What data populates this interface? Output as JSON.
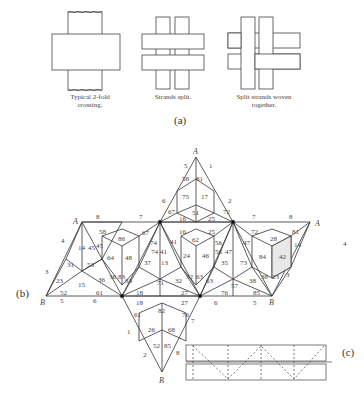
{
  "part_a": {
    "label": "(a)",
    "captions": [
      "Typical 2-fold crossing.",
      "Strands split.",
      "Split strands woven together."
    ],
    "caption_lines": [
      [
        "Typical 2-fold",
        "crossing."
      ],
      [
        "Strands split."
      ],
      [
        "Split strands woven",
        "together."
      ]
    ]
  },
  "part_b": {
    "label": "(b)",
    "vertex_labels": {
      "top": "A",
      "left_top": "A",
      "right_top": "A",
      "left_bottom": "B",
      "right_bottom": "B",
      "bottom": "B"
    },
    "arrow_labels": [
      {
        "text": "5",
        "x": 186,
        "y": 168
      },
      {
        "text": "1",
        "x": 211,
        "y": 168
      },
      {
        "text": "6",
        "x": 164,
        "y": 203
      },
      {
        "text": "2",
        "x": 230,
        "y": 203
      },
      {
        "text": "8",
        "x": 98,
        "y": 219
      },
      {
        "text": "7",
        "x": 141,
        "y": 219
      },
      {
        "text": "7",
        "x": 254,
        "y": 219
      },
      {
        "text": "8",
        "x": 291,
        "y": 219
      },
      {
        "text": "4",
        "x": 63,
        "y": 243
      },
      {
        "text": "4",
        "x": 345,
        "y": 246
      },
      {
        "text": "3",
        "x": 47,
        "y": 274
      },
      {
        "text": "3",
        "x": 288,
        "y": 277
      },
      {
        "text": "5",
        "x": 62,
        "y": 303
      },
      {
        "text": "6",
        "x": 95,
        "y": 303
      },
      {
        "text": "6",
        "x": 216,
        "y": 305
      },
      {
        "text": "5",
        "x": 255,
        "y": 305
      },
      {
        "text": "1",
        "x": 129,
        "y": 334
      },
      {
        "text": "7",
        "x": 193,
        "y": 323
      },
      {
        "text": "2",
        "x": 145,
        "y": 357
      },
      {
        "text": "8",
        "x": 178,
        "y": 355
      }
    ],
    "cell_numbers": [
      {
        "text": "58",
        "x": 186,
        "y": 179
      },
      {
        "text": "81",
        "x": 200,
        "y": 179
      },
      {
        "text": "75",
        "x": 186,
        "y": 197
      },
      {
        "text": "17",
        "x": 205,
        "y": 197
      },
      {
        "text": "67",
        "x": 172,
        "y": 212
      },
      {
        "text": "51",
        "x": 196,
        "y": 213
      },
      {
        "text": "72",
        "x": 227,
        "y": 212
      },
      {
        "text": "16",
        "x": 183,
        "y": 219
      },
      {
        "text": "25",
        "x": 212,
        "y": 219
      },
      {
        "text": "58",
        "x": 103,
        "y": 232
      },
      {
        "text": "86",
        "x": 122,
        "y": 239
      },
      {
        "text": "67",
        "x": 146,
        "y": 233
      },
      {
        "text": "16",
        "x": 183,
        "y": 232
      },
      {
        "text": "62",
        "x": 196,
        "y": 240
      },
      {
        "text": "25",
        "x": 212,
        "y": 232
      },
      {
        "text": "72",
        "x": 255,
        "y": 232
      },
      {
        "text": "28",
        "x": 274,
        "y": 239
      },
      {
        "text": "81",
        "x": 296,
        "y": 232
      },
      {
        "text": "14",
        "x": 82,
        "y": 248
      },
      {
        "text": "45",
        "x": 92,
        "y": 248
      },
      {
        "text": "45",
        "x": 100,
        "y": 246
      },
      {
        "text": "74",
        "x": 154,
        "y": 243
      },
      {
        "text": "74",
        "x": 155,
        "y": 252
      },
      {
        "text": "41",
        "x": 164,
        "y": 252
      },
      {
        "text": "41",
        "x": 174,
        "y": 242
      },
      {
        "text": "56",
        "x": 219,
        "y": 243
      },
      {
        "text": "56",
        "x": 219,
        "y": 252
      },
      {
        "text": "47",
        "x": 229,
        "y": 252
      },
      {
        "text": "47",
        "x": 247,
        "y": 243
      },
      {
        "text": "14",
        "x": 298,
        "y": 245
      },
      {
        "text": "31",
        "x": 71,
        "y": 265
      },
      {
        "text": "53",
        "x": 91,
        "y": 265
      },
      {
        "text": "64",
        "x": 111,
        "y": 258
      },
      {
        "text": "48",
        "x": 129,
        "y": 258
      },
      {
        "text": "37",
        "x": 148,
        "y": 263
      },
      {
        "text": "13",
        "x": 165,
        "y": 263
      },
      {
        "text": "24",
        "x": 187,
        "y": 256
      },
      {
        "text": "46",
        "x": 206,
        "y": 256
      },
      {
        "text": "35",
        "x": 225,
        "y": 263
      },
      {
        "text": "73",
        "x": 244,
        "y": 263
      },
      {
        "text": "84",
        "x": 263,
        "y": 257
      },
      {
        "text": "42",
        "x": 283,
        "y": 257
      },
      {
        "text": "23",
        "x": 60,
        "y": 281
      },
      {
        "text": "15",
        "x": 82,
        "y": 285
      },
      {
        "text": "36",
        "x": 102,
        "y": 280
      },
      {
        "text": "36",
        "x": 113,
        "y": 277
      },
      {
        "text": "83",
        "x": 122,
        "y": 277
      },
      {
        "text": "83",
        "x": 129,
        "y": 281
      },
      {
        "text": "71",
        "x": 161,
        "y": 283
      },
      {
        "text": "32",
        "x": 179,
        "y": 281
      },
      {
        "text": "32",
        "x": 190,
        "y": 277
      },
      {
        "text": "63",
        "x": 200,
        "y": 277
      },
      {
        "text": "63",
        "x": 210,
        "y": 281
      },
      {
        "text": "57",
        "x": 235,
        "y": 286
      },
      {
        "text": "38",
        "x": 253,
        "y": 281
      },
      {
        "text": "38",
        "x": 265,
        "y": 277
      },
      {
        "text": "23",
        "x": 276,
        "y": 277
      },
      {
        "text": "52",
        "x": 64,
        "y": 293
      },
      {
        "text": "61",
        "x": 100,
        "y": 293
      },
      {
        "text": "18",
        "x": 140,
        "y": 293
      },
      {
        "text": "27",
        "x": 185,
        "y": 293
      },
      {
        "text": "76",
        "x": 225,
        "y": 293
      },
      {
        "text": "85",
        "x": 257,
        "y": 293
      },
      {
        "text": "18",
        "x": 140,
        "y": 303
      },
      {
        "text": "82",
        "x": 162,
        "y": 311
      },
      {
        "text": "27",
        "x": 185,
        "y": 303
      },
      {
        "text": "61",
        "x": 138,
        "y": 315
      },
      {
        "text": "76",
        "x": 186,
        "y": 315
      },
      {
        "text": "26",
        "x": 152,
        "y": 330
      },
      {
        "text": "68",
        "x": 172,
        "y": 330
      },
      {
        "text": "52",
        "x": 157,
        "y": 346
      },
      {
        "text": "85",
        "x": 168,
        "y": 346
      }
    ]
  },
  "part_c": {
    "label": "(c)"
  }
}
